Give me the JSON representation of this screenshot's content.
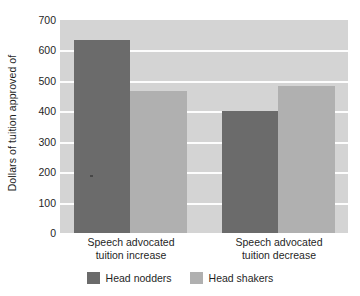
{
  "chart_data": {
    "type": "bar",
    "title": "",
    "subtitle": "",
    "xlabel": "",
    "ylabel": "Dollars of tuition approved of",
    "ylim": [
      0,
      700
    ],
    "yticks": [
      0,
      100,
      200,
      300,
      400,
      500,
      600,
      700
    ],
    "ytick_labels": [
      "0",
      "100",
      "200",
      "300",
      "400",
      "500",
      "600",
      "700"
    ],
    "grid": true,
    "grid_axis": "y",
    "grid_color": "#fdfdfd",
    "plot_background": "#d4d4d4",
    "legend_position": "bottom-center",
    "categories": [
      "Speech advocated tuition increase",
      "Speech advocated tuition decrease"
    ],
    "category_lines": [
      [
        "Speech advocated",
        "tuition increase"
      ],
      [
        "Speech advocated",
        "tuition decrease"
      ]
    ],
    "series": [
      {
        "name": "Head nodders",
        "color": "#6b6b6b",
        "values": [
          634,
          401
        ]
      },
      {
        "name": "Head shakers",
        "color": "#b0b0b0",
        "values": [
          467,
          483
        ]
      }
    ]
  }
}
